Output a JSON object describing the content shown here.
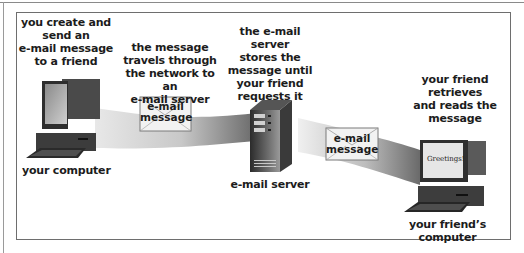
{
  "diagram": {
    "steps": [
      {
        "id": "create",
        "text_lines": [
          "you create and",
          "send an",
          "e-mail message",
          "to a friend"
        ]
      },
      {
        "id": "travel",
        "text_lines": [
          "the message",
          "travels through",
          "the network to an",
          "e-mail server"
        ]
      },
      {
        "id": "store",
        "text_lines": [
          "the e-mail server",
          "stores the",
          "message until",
          "your friend",
          "requests it"
        ]
      },
      {
        "id": "retrieve",
        "text_lines": [
          "your friend",
          "retrieves",
          "and reads the",
          "message"
        ]
      }
    ],
    "nodes": {
      "your_computer": "your computer",
      "email_server": "e-mail server",
      "friends_computer": "your friend’s computer"
    },
    "envelopes": [
      {
        "line1": "e-mail",
        "line2": "message"
      },
      {
        "line1": "e-mail",
        "line2": "message"
      }
    ],
    "screen_text": "Greetings!",
    "colors": {
      "frame": "#6e6e6e",
      "band_dark": "#6a6a6a",
      "band_light": "#e0e0e0",
      "device_dark": "#3a3a3a",
      "envelope": "#f2f2f2"
    }
  }
}
